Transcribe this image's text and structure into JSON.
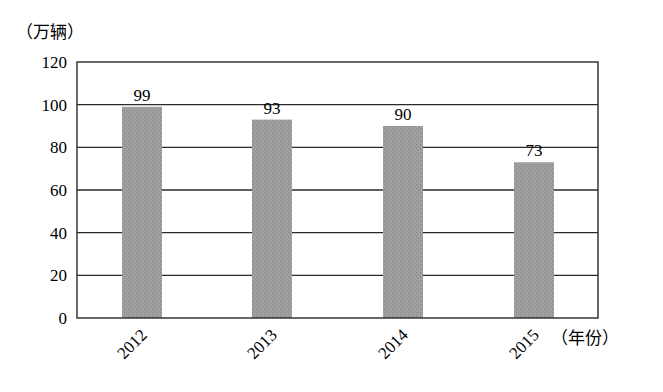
{
  "chart_data": {
    "type": "bar",
    "title": "",
    "xlabel": "（年份）",
    "ylabel": "（万辆）",
    "categories": [
      "2012",
      "2013",
      "2014",
      "2015"
    ],
    "values": [
      99,
      93,
      90,
      73
    ],
    "data_labels": [
      "99",
      "93",
      "90",
      "73"
    ],
    "ylim": [
      0,
      120
    ],
    "yticks": [
      0,
      20,
      40,
      60,
      80,
      100,
      120
    ],
    "ytick_labels": [
      "0",
      "20",
      "40",
      "60",
      "80",
      "100",
      "120"
    ],
    "grid": true,
    "legend": null,
    "bar_color": "#9a9a9a",
    "xtick_rotation": -45
  },
  "labels": {
    "y_unit": "（万辆）",
    "x_unit": "（年份）"
  }
}
